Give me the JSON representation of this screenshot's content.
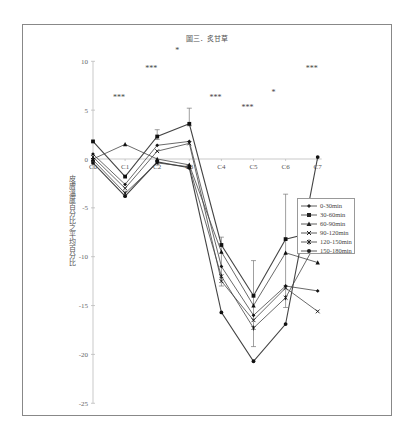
{
  "chart_data": {
    "type": "line",
    "title": "圖三．炙甘草",
    "xlabel": "",
    "ylabel": "皮膚溫度百分比之平均百分比",
    "categories": [
      "C0",
      "C1",
      "C2",
      "C3",
      "C4",
      "C5",
      "C6",
      "C7"
    ],
    "ylim": [
      -25,
      10
    ],
    "yticks": [
      10,
      5,
      0,
      -5,
      -10,
      -15,
      -20,
      -25
    ],
    "grid": false,
    "legend_position": "right",
    "series": [
      {
        "name": "0-30min",
        "marker": "diamond",
        "values": [
          0.5,
          -2.6,
          1.4,
          1.8,
          -11.0,
          -16.0,
          -13.0,
          -13.5
        ]
      },
      {
        "name": "30-60min",
        "marker": "square",
        "values": [
          1.8,
          -1.8,
          2.3,
          3.6,
          -8.8,
          -14.0,
          -8.2,
          -7.4
        ]
      },
      {
        "name": "60-90min",
        "marker": "triangle",
        "values": [
          0.0,
          1.5,
          0.0,
          -0.6,
          -9.5,
          -15.0,
          -9.6,
          -10.6
        ]
      },
      {
        "name": "90-120min",
        "marker": "x",
        "values": [
          0.2,
          -3.0,
          0.8,
          1.6,
          -12.5,
          -16.5,
          -13.2,
          -15.6
        ]
      },
      {
        "name": "120-150min",
        "marker": "star",
        "values": [
          -0.1,
          -3.5,
          -0.4,
          -0.8,
          -12.0,
          -17.3,
          -14.2,
          -8.3
        ]
      },
      {
        "name": "150-180min",
        "marker": "circle",
        "values": [
          -0.4,
          -3.8,
          -0.3,
          -0.9,
          -15.7,
          -20.7,
          -16.9,
          0.2
        ]
      }
    ],
    "error_bars": [
      {
        "category": "C2",
        "upper": 3.0,
        "lower": 2.0
      },
      {
        "category": "C3",
        "upper": 5.2,
        "lower": 3.4
      },
      {
        "category": "C4",
        "upper": -8.0,
        "lower": -13.0
      },
      {
        "category": "C5",
        "upper": -10.4,
        "lower": -19.2
      },
      {
        "category": "C6",
        "upper": -3.6,
        "lower": -15.2
      }
    ],
    "annotations": [
      {
        "text": "***",
        "near": "C1",
        "y": 6.0
      },
      {
        "text": "***",
        "near": "C2",
        "y": 9.0
      },
      {
        "text": "*",
        "near": "C3",
        "y": 10.8
      },
      {
        "text": "***",
        "near": "C4",
        "y": 6.0
      },
      {
        "text": "***",
        "near": "C5",
        "y": 5.0
      },
      {
        "text": "*",
        "near": "C6",
        "y": 6.5
      },
      {
        "text": "***",
        "near": "C7",
        "y": 9.0
      }
    ]
  },
  "legend": {
    "items": [
      "0-30min",
      "30-60min",
      "60-90min",
      "90-120min",
      "120-150min",
      "150-180min"
    ]
  }
}
